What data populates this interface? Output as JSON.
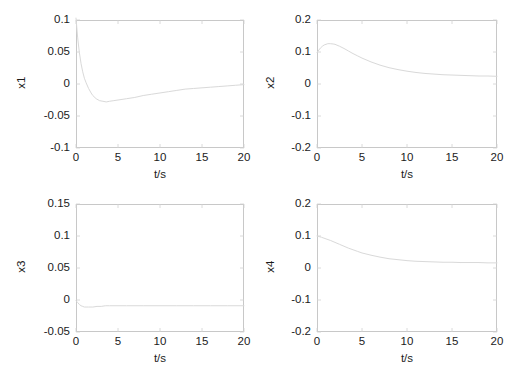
{
  "figure": {
    "background": "#ffffff",
    "line_color": "#d9d9d9",
    "axis_color": "#c8c8c8",
    "tick_color": "#1b1b1b",
    "layout": "2x2 subplot grid"
  },
  "chart_data": [
    {
      "type": "line",
      "id": "x1",
      "title": "",
      "xlabel": "t/s",
      "ylabel": "x1",
      "xlim": [
        0,
        20
      ],
      "ylim": [
        -0.1,
        0.1
      ],
      "xticks": [
        0,
        5,
        10,
        15,
        20
      ],
      "xticklabels": [
        "0",
        "5",
        "10",
        "15",
        "20"
      ],
      "yticks": [
        -0.1,
        -0.05,
        0,
        0.05,
        0.1
      ],
      "yticklabels": [
        "-0.1",
        "-0.05",
        "0",
        "0.05",
        "0.1"
      ],
      "grid": false,
      "legend": null,
      "x": [
        0,
        0.2,
        0.4,
        0.6,
        0.8,
        1.0,
        1.2,
        1.5,
        1.8,
        2.0,
        2.4,
        2.8,
        3.2,
        3.6,
        4.0,
        4.5,
        5.0,
        6.0,
        7.0,
        8.0,
        9.0,
        10.0,
        11.0,
        12.0,
        13.0,
        14.0,
        15.0,
        16.0,
        17.0,
        18.0,
        19.0,
        20.0
      ],
      "y": [
        0.103,
        0.072,
        0.049,
        0.032,
        0.019,
        0.009,
        0.002,
        -0.007,
        -0.014,
        -0.018,
        -0.023,
        -0.026,
        -0.027,
        -0.028,
        -0.027,
        -0.026,
        -0.025,
        -0.023,
        -0.021,
        -0.018,
        -0.016,
        -0.014,
        -0.012,
        -0.01,
        -0.008,
        -0.007,
        -0.006,
        -0.005,
        -0.004,
        -0.003,
        -0.002,
        -0.001
      ]
    },
    {
      "type": "line",
      "id": "x2",
      "title": "",
      "xlabel": "t/s",
      "ylabel": "x2",
      "xlim": [
        0,
        20
      ],
      "ylim": [
        -0.2,
        0.2
      ],
      "xticks": [
        0,
        5,
        10,
        15,
        20
      ],
      "xticklabels": [
        "0",
        "5",
        "10",
        "15",
        "20"
      ],
      "yticks": [
        -0.2,
        -0.1,
        0,
        0.1,
        0.2
      ],
      "yticklabels": [
        "-0.2",
        "-0.1",
        "0",
        "0.1",
        "0.2"
      ],
      "grid": false,
      "legend": null,
      "x": [
        0,
        0.2,
        0.4,
        0.6,
        0.8,
        1.0,
        1.2,
        1.5,
        1.8,
        2.0,
        2.5,
        3.0,
        3.5,
        4.0,
        4.5,
        5.0,
        6.0,
        7.0,
        8.0,
        9.0,
        10.0,
        11.0,
        12.0,
        13.0,
        14.0,
        15.0,
        16.0,
        17.0,
        18.0,
        19.0,
        20.0
      ],
      "y": [
        0.098,
        0.106,
        0.113,
        0.118,
        0.122,
        0.124,
        0.126,
        0.126,
        0.125,
        0.124,
        0.118,
        0.111,
        0.103,
        0.095,
        0.088,
        0.081,
        0.069,
        0.059,
        0.051,
        0.045,
        0.04,
        0.036,
        0.033,
        0.031,
        0.029,
        0.028,
        0.027,
        0.026,
        0.025,
        0.025,
        0.024
      ]
    },
    {
      "type": "line",
      "id": "x3",
      "title": "",
      "xlabel": "t/s",
      "ylabel": "x3",
      "xlim": [
        0,
        20
      ],
      "ylim": [
        -0.05,
        0.15
      ],
      "xticks": [
        0,
        5,
        10,
        15,
        20
      ],
      "xticklabels": [
        "0",
        "5",
        "10",
        "15",
        "20"
      ],
      "yticks": [
        -0.05,
        0,
        0.05,
        0.1,
        0.15
      ],
      "yticklabels": [
        "-0.05",
        "0",
        "0.05",
        "0.1",
        "0.15"
      ],
      "grid": false,
      "legend": null,
      "x": [
        0,
        0.2,
        0.4,
        0.6,
        0.8,
        1.0,
        1.2,
        1.5,
        2.0,
        2.5,
        3.0,
        3.5,
        4.0,
        5.0,
        6.0,
        8.0,
        10.0,
        12.0,
        14.0,
        16.0,
        18.0,
        20.0
      ],
      "y": [
        -0.001,
        -0.004,
        -0.007,
        -0.009,
        -0.01,
        -0.011,
        -0.011,
        -0.011,
        -0.011,
        -0.01,
        -0.01,
        -0.009,
        -0.009,
        -0.009,
        -0.009,
        -0.009,
        -0.009,
        -0.009,
        -0.009,
        -0.009,
        -0.009,
        -0.009
      ]
    },
    {
      "type": "line",
      "id": "x4",
      "title": "",
      "xlabel": "t/s",
      "ylabel": "x4",
      "xlim": [
        0,
        20
      ],
      "ylim": [
        -0.2,
        0.2
      ],
      "xticks": [
        0,
        5,
        10,
        15,
        20
      ],
      "xticklabels": [
        "0",
        "5",
        "10",
        "15",
        "20"
      ],
      "yticks": [
        -0.2,
        -0.1,
        0,
        0.1,
        0.2
      ],
      "yticklabels": [
        "-0.2",
        "-0.1",
        "0",
        "0.1",
        "0.2"
      ],
      "grid": false,
      "legend": null,
      "x": [
        0,
        0.5,
        1.0,
        1.5,
        2.0,
        2.5,
        3.0,
        3.5,
        4.0,
        4.5,
        5.0,
        6.0,
        7.0,
        8.0,
        9.0,
        10.0,
        11.0,
        12.0,
        13.0,
        14.0,
        15.0,
        16.0,
        17.0,
        18.0,
        19.0,
        20.0
      ],
      "y": [
        0.1,
        0.096,
        0.091,
        0.086,
        0.08,
        0.074,
        0.068,
        0.062,
        0.057,
        0.052,
        0.047,
        0.04,
        0.034,
        0.029,
        0.026,
        0.023,
        0.021,
        0.02,
        0.019,
        0.018,
        0.018,
        0.017,
        0.017,
        0.017,
        0.016,
        0.016
      ]
    }
  ]
}
